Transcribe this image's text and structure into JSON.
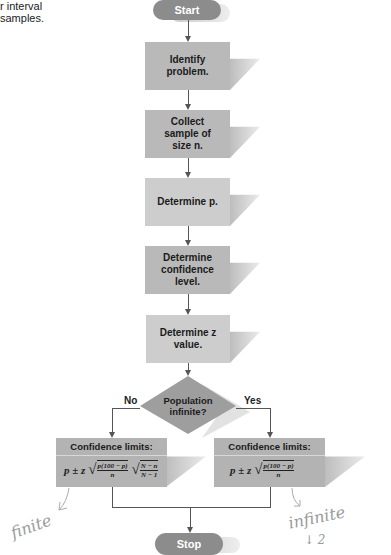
{
  "caption": {
    "line1": "r interval",
    "line2": "samples."
  },
  "flowchart": {
    "start": "Start",
    "steps": [
      {
        "line1": "Identify",
        "line2": "problem.",
        "line3": ""
      },
      {
        "line1": "Collect",
        "line2": "sample of",
        "line3": "size n."
      },
      {
        "line1": "Determine p.",
        "line2": "",
        "line3": ""
      },
      {
        "line1": "Determine",
        "line2": "confidence",
        "line3": "level."
      },
      {
        "line1": "Determine z",
        "line2": "value.",
        "line3": ""
      }
    ],
    "decision": {
      "line1": "Population",
      "line2": "infinite?"
    },
    "branch_no": "No",
    "branch_yes": "Yes",
    "left_result": {
      "title": "Confidence limits:",
      "prefix": "p ± z",
      "frac1_num": "p(100 − p)",
      "frac1_den": "n",
      "frac2_num": "N − n",
      "frac2_den": "N − 1"
    },
    "right_result": {
      "title": "Confidence limits:",
      "prefix": "p ± z",
      "frac1_num": "p(100 − p)",
      "frac1_den": "n"
    },
    "stop": "Stop"
  },
  "annotations": {
    "left": "finite",
    "right": "infinite",
    "right_sub": "↓ 2"
  },
  "colors": {
    "terminal": "#8c8c8c",
    "process": "#b9b9b9",
    "decision": "#9e9e9e",
    "connector": "#555555",
    "handwriting": "#9a9a9a"
  }
}
